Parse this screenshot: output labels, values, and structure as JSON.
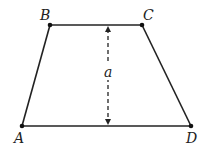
{
  "figure": {
    "shape": "trapezoid",
    "vertices": {
      "A": {
        "label": "A",
        "x": 22,
        "y": 126
      },
      "B": {
        "label": "B",
        "x": 50,
        "y": 25
      },
      "C": {
        "label": "C",
        "x": 142,
        "y": 25
      },
      "D": {
        "label": "D",
        "x": 191,
        "y": 126
      }
    },
    "height_marker": {
      "label": "a",
      "x": 108,
      "y_top": 25,
      "y_bottom": 126,
      "style": "dashed double-arrow"
    },
    "colors": {
      "stroke": "#222222",
      "background": "#ffffff"
    }
  }
}
